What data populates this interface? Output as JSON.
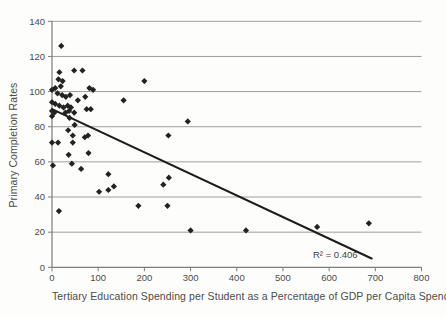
{
  "colors": {
    "background": "#fdfdfb",
    "grid": "#9e9e9e",
    "axis": "#7c7c7c",
    "tick_text": "#4c4c4c",
    "caption_text": "#4c4c4c",
    "marker": "#222222",
    "trend_line": "#1c1c1c"
  },
  "chart_data": {
    "type": "scatter",
    "title": "",
    "xlabel": "Tertiary Education Spending per Student as a Percentage of GDP per Capita Spending",
    "ylabel": "Primary Completion Rates",
    "xlim": [
      0,
      800
    ],
    "ylim": [
      0,
      140
    ],
    "x_ticks": [
      0,
      100,
      200,
      300,
      400,
      500,
      600,
      700,
      800
    ],
    "y_ticks": [
      0,
      20,
      40,
      60,
      80,
      100,
      120,
      140
    ],
    "grid": "horizontal",
    "legend": "none",
    "marker_shape": "diamond",
    "points": [
      [
        20,
        126
      ],
      [
        16,
        111
      ],
      [
        48,
        112
      ],
      [
        66,
        112
      ],
      [
        14,
        107
      ],
      [
        23,
        106
      ],
      [
        7,
        102
      ],
      [
        0,
        101
      ],
      [
        19,
        103
      ],
      [
        81,
        102
      ],
      [
        89,
        101
      ],
      [
        200,
        106
      ],
      [
        12,
        99
      ],
      [
        22,
        98
      ],
      [
        30,
        97
      ],
      [
        39,
        98
      ],
      [
        56,
        95
      ],
      [
        72,
        97
      ],
      [
        155,
        95
      ],
      [
        0,
        94
      ],
      [
        7,
        93
      ],
      [
        16,
        92
      ],
      [
        25,
        91
      ],
      [
        34,
        92
      ],
      [
        41,
        91
      ],
      [
        0,
        89
      ],
      [
        5,
        88
      ],
      [
        29,
        88
      ],
      [
        37,
        89
      ],
      [
        48,
        88
      ],
      [
        75,
        90
      ],
      [
        84,
        90
      ],
      [
        0,
        86
      ],
      [
        38,
        85
      ],
      [
        49,
        81
      ],
      [
        294,
        83
      ],
      [
        35,
        78
      ],
      [
        45,
        75
      ],
      [
        71,
        74
      ],
      [
        78,
        75
      ],
      [
        252,
        75
      ],
      [
        0,
        71
      ],
      [
        13,
        71
      ],
      [
        45,
        71
      ],
      [
        36,
        64
      ],
      [
        79,
        65
      ],
      [
        2,
        58
      ],
      [
        43,
        59
      ],
      [
        63,
        56
      ],
      [
        122,
        53
      ],
      [
        253,
        51
      ],
      [
        102,
        43
      ],
      [
        122,
        44
      ],
      [
        134,
        46
      ],
      [
        241,
        47
      ],
      [
        15,
        32
      ],
      [
        187,
        35
      ],
      [
        250,
        35
      ],
      [
        300,
        21
      ],
      [
        420,
        21
      ],
      [
        574,
        23
      ],
      [
        686,
        25
      ]
    ],
    "trendline": {
      "x_start": 0,
      "y_start": 90,
      "x_end": 692,
      "y_end": 5
    },
    "r_squared_label": "R² = 0.406"
  }
}
